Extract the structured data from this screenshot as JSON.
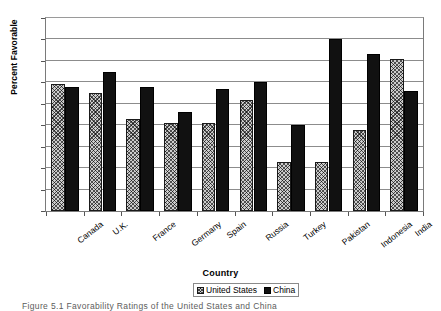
{
  "figure": {
    "caption": "Figure 5.1   Favorability Ratings of the United States and China"
  },
  "chart_data": {
    "type": "bar",
    "title": "",
    "xlabel": "Country",
    "ylabel": "Percent Favorable",
    "ylim": [
      0,
      90
    ],
    "ytick_step": 10,
    "yticks": [
      90,
      80,
      70,
      60,
      50,
      40,
      30,
      20,
      10,
      0
    ],
    "grid": true,
    "legend_position": "bottom-center",
    "categories": [
      "Canada",
      "U.K.",
      "France",
      "Germany",
      "Spain",
      "Russia",
      "Turkey",
      "Pakistan",
      "Indonesia",
      "India"
    ],
    "series": [
      {
        "name": "United States",
        "color": "#cdcdcd",
        "pattern": "cross-hatch",
        "values": [
          59,
          55,
          43,
          41,
          41,
          52,
          23,
          23,
          38,
          71
        ]
      },
      {
        "name": "China",
        "color": "#111111",
        "pattern": "solid",
        "values": [
          58,
          65,
          58,
          46,
          57,
          60,
          40,
          80,
          73,
          56
        ]
      }
    ]
  }
}
